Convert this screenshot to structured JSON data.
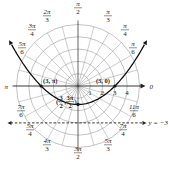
{
  "figure": {
    "type": "polar-graph",
    "curve": "parabola r = 3/(1 - sin θ)",
    "pole": {
      "x": 78,
      "y": 86
    },
    "unit_px": 12.3,
    "grid_radii": [
      1,
      2,
      3,
      4,
      5
    ],
    "grid_angle_step_deg": 15,
    "polar_axis_label": "0",
    "pi_label": "π",
    "radial_ticks": [
      "1",
      "2",
      "3",
      "4"
    ],
    "angle_labels": [
      {
        "id": "pi-2",
        "num": "π",
        "den": "2",
        "x": 78,
        "y": 6
      },
      {
        "id": "pi-3",
        "num": "π",
        "den": "3",
        "x": 108,
        "y": 14
      },
      {
        "id": "pi-4",
        "num": "π",
        "den": "4",
        "x": 125,
        "y": 28
      },
      {
        "id": "pi-6",
        "num": "π",
        "den": "6",
        "x": 133,
        "y": 46
      },
      {
        "id": "2pi-3",
        "num": "2π",
        "den": "3",
        "x": 47,
        "y": 14
      },
      {
        "id": "3pi-4",
        "num": "3π",
        "den": "4",
        "x": 32,
        "y": 28
      },
      {
        "id": "5pi-6",
        "num": "5π",
        "den": "6",
        "x": 22,
        "y": 46
      },
      {
        "id": "7pi-6",
        "num": "7π",
        "den": "6",
        "x": 21,
        "y": 109
      },
      {
        "id": "5pi-4",
        "num": "5π",
        "den": "4",
        "x": 30,
        "y": 128
      },
      {
        "id": "4pi-3",
        "num": "4π",
        "den": "3",
        "x": 47,
        "y": 143
      },
      {
        "id": "3pi-2",
        "num": "3π",
        "den": "2",
        "x": 78,
        "y": 151
      },
      {
        "id": "5pi-3",
        "num": "5π",
        "den": "3",
        "x": 108,
        "y": 143
      },
      {
        "id": "7pi-4",
        "num": "7π",
        "den": "4",
        "x": 123,
        "y": 128
      },
      {
        "id": "11pi-6",
        "num": "11π",
        "den": "6",
        "x": 134,
        "y": 109
      }
    ],
    "points": [
      {
        "id": "3-pi",
        "label": "(3, π)",
        "r": 3,
        "theta": "π"
      },
      {
        "id": "3-0",
        "label": "(3, 0)",
        "r": 3,
        "theta": "0"
      },
      {
        "id": "3half-3pi2",
        "label_num_r": "3",
        "label_den_r": "2",
        "label_num_t": "3π",
        "label_den_t": "2",
        "r": 1.5,
        "theta": "3π/2"
      }
    ],
    "directrix_label": "y = −3",
    "colors": {
      "grid": "#9a9a9a",
      "axis": "#222222",
      "curve": "#111111",
      "text": "#222222",
      "background": "#ffffff"
    }
  }
}
